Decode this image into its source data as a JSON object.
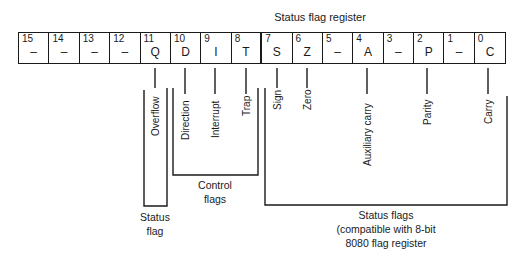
{
  "diagram": {
    "title": "Status flag register",
    "bits": [
      {
        "num": "15",
        "flag": "–"
      },
      {
        "num": "14",
        "flag": "–"
      },
      {
        "num": "13",
        "flag": "–"
      },
      {
        "num": "12",
        "flag": "–"
      },
      {
        "num": "11",
        "flag": "Q"
      },
      {
        "num": "10",
        "flag": "D"
      },
      {
        "num": "9",
        "flag": "I"
      },
      {
        "num": "8",
        "flag": "T"
      },
      {
        "num": "7",
        "flag": "S"
      },
      {
        "num": "6",
        "flag": "Z"
      },
      {
        "num": "5",
        "flag": "–"
      },
      {
        "num": "4",
        "flag": "A"
      },
      {
        "num": "3",
        "flag": "–"
      },
      {
        "num": "2",
        "flag": "P"
      },
      {
        "num": "1",
        "flag": "–"
      },
      {
        "num": "0",
        "flag": "C"
      }
    ],
    "flag_labels": {
      "overflow": "Overflow",
      "direction": "Direction",
      "interrupt": "Interrupt",
      "trap": "Trap",
      "sign": "Sign",
      "zero": "Zero",
      "auxiliary_carry": "Auxiliary carry",
      "parity": "Parity",
      "carry": "Carry"
    },
    "groups": {
      "status_flag": {
        "line1": "Status",
        "line2": "flag"
      },
      "control_flags": {
        "line1": "Control",
        "line2": "flags"
      },
      "status_flags": {
        "line1": "Status flags",
        "line2": "(compatible with 8-bit",
        "line3": "8080 flag register"
      }
    }
  }
}
